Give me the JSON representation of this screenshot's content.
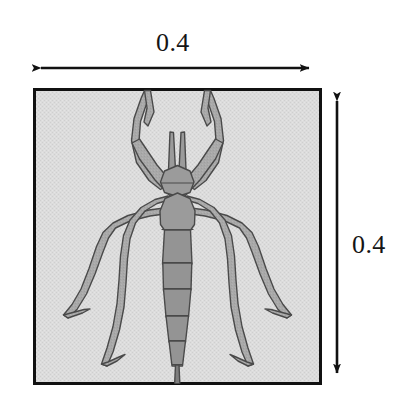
{
  "figure": {
    "canvas": {
      "width": 410,
      "height": 395,
      "background": "#ffffff"
    },
    "box": {
      "name": "specimen-box",
      "x": 33,
      "y": 88,
      "width": 289,
      "height": 297,
      "fill": "#d9d9d9",
      "stroke": "#111111",
      "stroke_width": 3
    },
    "dimensions": [
      {
        "id": "width-dimension",
        "label": "0.4",
        "orientation": "horizontal",
        "arrow_from": {
          "x": 32,
          "y": 68
        },
        "arrow_to": {
          "x": 318,
          "y": 68
        },
        "label_position": {
          "x": 156,
          "y": 30
        },
        "color": "#111111"
      },
      {
        "id": "height-dimension",
        "label": "0.4",
        "orientation": "vertical",
        "arrow_from": {
          "x": 337,
          "y": 92
        },
        "arrow_to": {
          "x": 337,
          "y": 382
        },
        "label_position": {
          "x": 352,
          "y": 232
        },
        "color": "#111111"
      }
    ],
    "specimen": {
      "name": "stick-insect",
      "body_fill": "#9b9b9b",
      "limb_fill": "#a9a9a9",
      "outline": "#4a4a4a",
      "outline_width": 1.4,
      "parts": [
        "left-antenna",
        "right-antenna",
        "head",
        "thorax",
        "abdomen-segment-1",
        "abdomen-segment-2",
        "abdomen-segment-3",
        "abdomen-segment-4",
        "abdomen-segment-5",
        "tail-tip",
        "left-foreleg",
        "right-foreleg",
        "left-midleg",
        "right-midleg",
        "left-hindleg",
        "right-hindleg"
      ]
    }
  }
}
